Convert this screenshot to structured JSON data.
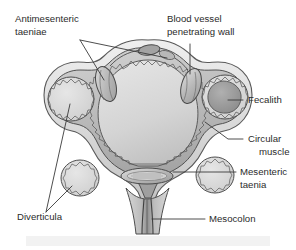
{
  "figure": {
    "name": "colonic-diverticulosis-cross-section",
    "background_color": "#ffffff",
    "band_color": "#f2f2f2",
    "ink_color": "#2b2b2b",
    "label_font_size_px": 9.6
  },
  "labels": [
    {
      "id": "antimesenteric-taeniae",
      "lines": [
        "Antimesenteric",
        "taeniae"
      ],
      "x": 15,
      "y": 22,
      "align": "start"
    },
    {
      "id": "blood-vessel-penetrating-wall",
      "lines": [
        "Blood vessel",
        "penetrating wall"
      ],
      "x": 167,
      "y": 22,
      "align": "start"
    },
    {
      "id": "fecalith",
      "lines": [
        "Fecalith"
      ],
      "x": 248,
      "y": 103,
      "align": "start"
    },
    {
      "id": "circular-muscle",
      "lines": [
        "Circular",
        "muscle"
      ],
      "x": 248,
      "y": 142,
      "align": "start"
    },
    {
      "id": "mesenteric-taenia",
      "lines": [
        "Mesenteric",
        "taenia"
      ],
      "x": 240,
      "y": 175,
      "align": "start"
    },
    {
      "id": "diverticula",
      "lines": [
        "Diverticula"
      ],
      "x": 17,
      "y": 220,
      "align": "start"
    },
    {
      "id": "mesocolon",
      "lines": [
        "Mesocolon"
      ],
      "x": 209,
      "y": 222,
      "align": "start"
    }
  ],
  "anatomy": {
    "structures": [
      {
        "id": "serosa-outer-wall",
        "color": "#e9e9e9"
      },
      {
        "id": "longitudinal-muscle",
        "color": "#c9c9c9"
      },
      {
        "id": "circular-muscle-layer",
        "color": "#b4b4b4"
      },
      {
        "id": "submucosa",
        "color": "#8f8f8f"
      },
      {
        "id": "mucosa-zigzag",
        "color": "#6e6e6e"
      },
      {
        "id": "colon-lumen",
        "color": "#d7d7d7"
      },
      {
        "id": "fecalith-mass",
        "color": "#9a9a9a"
      },
      {
        "id": "mesenteric-taenia-ellipse",
        "color": "#bdbdbd"
      },
      {
        "id": "mesocolon-stalk",
        "color": "#cfcfcf"
      },
      {
        "id": "antimesenteric-taenia-left",
        "color": "#c4c4c4"
      },
      {
        "id": "antimesenteric-taenia-right",
        "color": "#c4c4c4"
      },
      {
        "id": "blood-vessel",
        "color": "#8a8a8a"
      },
      {
        "id": "diverticulum-left",
        "color": "#dcdcdc"
      },
      {
        "id": "diverticulum-right",
        "color": "#dcdcdc"
      },
      {
        "id": "diverticulum-lower-left",
        "color": "#dcdcdc"
      },
      {
        "id": "diverticulum-lower-right",
        "color": "#dcdcdc"
      }
    ]
  }
}
